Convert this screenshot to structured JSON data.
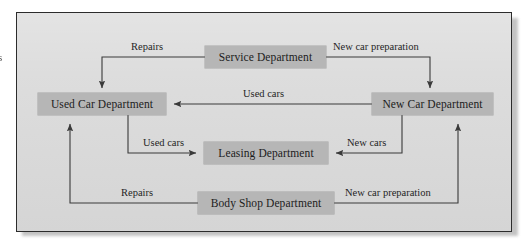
{
  "figure": {
    "type": "flow-diagram",
    "background_color": "#dcdcdc",
    "box_fill_color": "#b6b6b6",
    "line_color": "#3a3a3a",
    "border_color": "#2c2c2c",
    "margin_fragment_text": "s"
  },
  "nodes": [
    {
      "id": "service",
      "label": "Service Department"
    },
    {
      "id": "used_car",
      "label": "Used Car Department"
    },
    {
      "id": "new_car",
      "label": "New Car Department"
    },
    {
      "id": "leasing",
      "label": "Leasing Department"
    },
    {
      "id": "body_shop",
      "label": "Body Shop Department"
    }
  ],
  "edges": [
    {
      "id": "e1",
      "from": "service",
      "to": "used_car",
      "label": "Repairs"
    },
    {
      "id": "e2",
      "from": "service",
      "to": "new_car",
      "label": "New car preparation"
    },
    {
      "id": "e3",
      "from": "new_car",
      "to": "used_car",
      "label": "Used cars"
    },
    {
      "id": "e4",
      "from": "used_car",
      "to": "leasing",
      "label": "Used cars"
    },
    {
      "id": "e5",
      "from": "new_car",
      "to": "leasing",
      "label": "New cars"
    },
    {
      "id": "e6",
      "from": "body_shop",
      "to": "used_car",
      "label": "Repairs"
    },
    {
      "id": "e7",
      "from": "body_shop",
      "to": "new_car",
      "label": "New car preparation"
    }
  ]
}
